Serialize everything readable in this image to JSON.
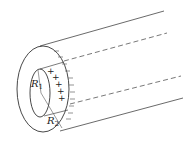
{
  "diagram": {
    "type": "coaxial-cylinder",
    "labels": {
      "inner_radius": {
        "symbol": "R",
        "subscript": "1"
      },
      "outer_radius": {
        "symbol": "R",
        "subscript": "2"
      }
    },
    "inner_charge_sign": "+",
    "outer_charge_sign": "−",
    "plus_count": 6,
    "minus_count": 12,
    "colors": {
      "stroke": "#333333",
      "background": "#ffffff"
    }
  }
}
